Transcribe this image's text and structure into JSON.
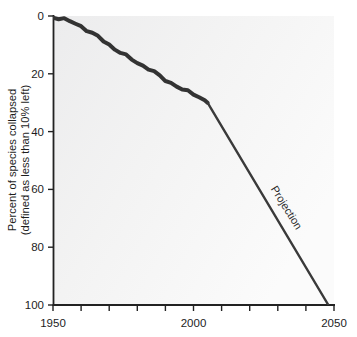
{
  "chart_data": {
    "type": "line",
    "title": "",
    "subtitle": "",
    "xlabel": "",
    "ylabel": "Percent of species collapsed (defined as less than 10% left)",
    "ylabel_line1": "Percent of species collapsed",
    "ylabel_line2": "(defined as less than 10% left)",
    "xlim": [
      1950,
      2050
    ],
    "ylim": [
      0,
      100
    ],
    "y_inverted": true,
    "grid": false,
    "legend": "none",
    "x_ticks": [
      1950,
      1960,
      1970,
      1980,
      1990,
      2000,
      2010,
      2020,
      2030,
      2040,
      2050
    ],
    "x_tick_labels": [
      "1950",
      "",
      "",
      "",
      "",
      "2000",
      "",
      "",
      "",
      "",
      "2050"
    ],
    "y_ticks": [
      0,
      20,
      40,
      60,
      80,
      100
    ],
    "y_tick_labels": [
      "0",
      "20",
      "40",
      "60",
      "80",
      "100"
    ],
    "annotations": [
      {
        "text": "Projection",
        "x": 2032,
        "y": 67,
        "rotation_deg": 58
      }
    ],
    "series": [
      {
        "name": "Observed",
        "style": "thick-jagged",
        "color": "#333333",
        "line_width": 4,
        "x": [
          1950,
          1952,
          1954,
          1956,
          1958,
          1960,
          1962,
          1964,
          1966,
          1968,
          1970,
          1972,
          1974,
          1976,
          1978,
          1980,
          1982,
          1984,
          1986,
          1988,
          1990,
          1992,
          1994,
          1996,
          1998,
          2000,
          2002,
          2004,
          2005
        ],
        "values": [
          0.6,
          0.8,
          1.2,
          1.8,
          2.6,
          3.6,
          4.8,
          6.0,
          7.2,
          8.6,
          10.0,
          11.4,
          12.6,
          13.8,
          15.0,
          16.2,
          17.2,
          18.2,
          19.4,
          20.8,
          22.2,
          23.2,
          24.2,
          25.4,
          26.2,
          27.0,
          28.0,
          29.2,
          30.0
        ]
      },
      {
        "name": "Projection",
        "style": "thin-straight",
        "color": "#3a3a3a",
        "line_width": 2.4,
        "x": [
          2005,
          2048
        ],
        "values": [
          30,
          100
        ]
      }
    ]
  },
  "axes": {
    "y_axis_name": "percent-species-collapsed-axis",
    "x_axis_name": "year-axis"
  }
}
